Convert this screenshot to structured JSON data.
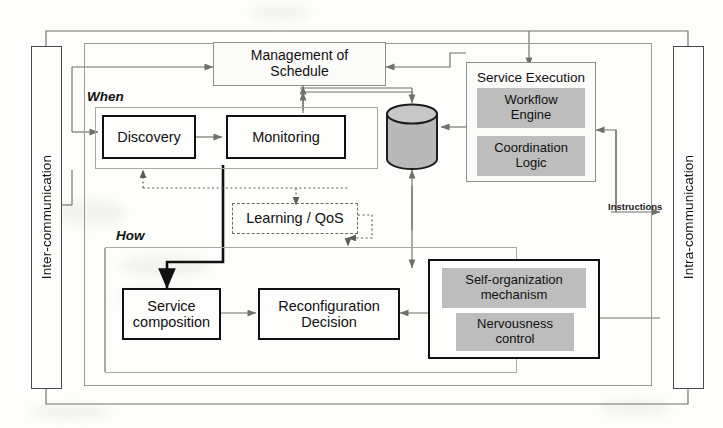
{
  "diagram": {
    "type": "block-diagram",
    "colors": {
      "chip_fill": "#bdbdbd",
      "bold_stroke": "#111111",
      "light_stroke": "#8d8d89",
      "frame_stroke": "#9a9a96",
      "background": "#fdfdfb"
    }
  },
  "sidebars": {
    "left": {
      "label": "Inter-communication"
    },
    "right": {
      "label": "Intra-communication"
    }
  },
  "groups": {
    "when": {
      "label": "When"
    },
    "how": {
      "label": "How"
    }
  },
  "nodes": {
    "management_of_schedule": {
      "line1": "Management of",
      "line2": "Schedule"
    },
    "discovery": {
      "label": "Discovery"
    },
    "monitoring": {
      "label": "Monitoring"
    },
    "learning_qos": {
      "label": "Learning / QoS"
    },
    "service_composition": {
      "line1": "Service",
      "line2": "composition"
    },
    "reconfiguration_decision": {
      "line1": "Reconfiguration",
      "line2": "Decision"
    },
    "service_execution": {
      "title": "Service Execution"
    },
    "workflow_engine": {
      "line1": "Workflow",
      "line2": "Engine"
    },
    "coordination_logic": {
      "line1": "Coordination",
      "line2": "Logic"
    },
    "self_organization": {
      "line1": "Self-organization",
      "line2": "mechanism"
    },
    "nervousness_control": {
      "line1": "Nervousness",
      "line2": "control"
    },
    "repository": {
      "label": ""
    }
  },
  "edge_labels": {
    "instructions": "Instructions"
  }
}
